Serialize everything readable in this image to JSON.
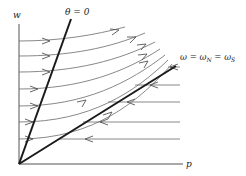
{
  "diagram": {
    "type": "phase-portrait",
    "axes": {
      "x_label": "p",
      "y_label": "w"
    },
    "lines": {
      "theta_zero": {
        "label": "θ = 0"
      },
      "separatrix": {
        "label": "ω = ωN = ωS",
        "parts": [
          "ω = ω",
          "N",
          " = ω",
          "S"
        ]
      }
    },
    "flow_curves_rightward": 7,
    "flow_lines_leftward": 5,
    "colors": {
      "background": "#ffffff",
      "thick_line": "#1a1a1a",
      "flow_line": "#6a6a6a",
      "axis": "#555555"
    }
  }
}
